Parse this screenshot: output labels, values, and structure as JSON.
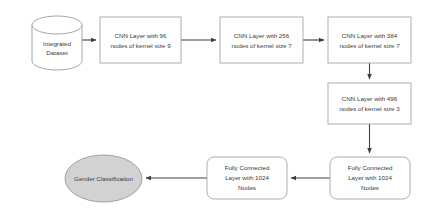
{
  "diagram": {
    "background_color": "#ffffff",
    "nodes": [
      {
        "id": "integrated-dataset",
        "shape": "cylinder",
        "label_lines": [
          "Integrated",
          "Dataset"
        ],
        "fill": "#ffffff",
        "stroke": "#8f8f8f",
        "x": 32,
        "y": 16,
        "width": 50,
        "height": 54
      },
      {
        "id": "cnn-layer-96",
        "shape": "rectangle",
        "label_lines": [
          "CNN Layer with 96",
          "nodes of kernel size 9"
        ],
        "fill": "#ffffff",
        "stroke": "#9a9a9a",
        "x": 100,
        "y": 17,
        "width": 81,
        "height": 46
      },
      {
        "id": "cnn-layer-256",
        "shape": "rectangle",
        "label_lines": [
          "CNN Layer with 256",
          "nodes of kernel size 7"
        ],
        "fill": "#ffffff",
        "stroke": "#9a9a9a",
        "x": 220,
        "y": 17,
        "width": 83,
        "height": 46
      },
      {
        "id": "cnn-layer-384",
        "shape": "rectangle",
        "label_lines": [
          "CNN Layer with 384",
          "nodes of kernel size 7"
        ],
        "fill": "#ffffff",
        "stroke": "#9a9a9a",
        "x": 328,
        "y": 17,
        "width": 83,
        "height": 46
      },
      {
        "id": "cnn-layer-496",
        "shape": "rectangle",
        "label_lines": [
          "CNN Layer with 496",
          "nodes of kernel size 3"
        ],
        "fill": "#ffffff",
        "stroke": "#9a9a9a",
        "x": 328,
        "y": 83,
        "width": 83,
        "height": 41
      },
      {
        "id": "fully-connected-right",
        "shape": "rounded-rectangle",
        "label_lines": [
          "Fully Connected",
          "Layer with 1024",
          "Nodes"
        ],
        "fill": "#ffffff",
        "stroke": "#9a9a9a",
        "x": 330,
        "y": 157,
        "width": 80,
        "height": 42
      },
      {
        "id": "fully-connected-middle",
        "shape": "rounded-rectangle",
        "label_lines": [
          "Fully Connected",
          "Layer with 1024",
          "Nodes"
        ],
        "fill": "#ffffff",
        "stroke": "#9a9a9a",
        "x": 207,
        "y": 157,
        "width": 80,
        "height": 42
      },
      {
        "id": "gender-classification",
        "shape": "ellipse",
        "label_lines": [
          "Gender Classification"
        ],
        "fill": "#d2d2d2",
        "stroke": "#8f8f8f",
        "x": 65,
        "y": 155,
        "width": 77,
        "height": 47
      }
    ],
    "edges": [
      {
        "id": "edge-dataset-to-cnn96",
        "from": "integrated-dataset",
        "to": "cnn-layer-96",
        "direction": "right"
      },
      {
        "id": "edge-cnn96-to-cnn256",
        "from": "cnn-layer-96",
        "to": "cnn-layer-256",
        "direction": "right"
      },
      {
        "id": "edge-cnn256-to-cnn384",
        "from": "cnn-layer-256",
        "to": "cnn-layer-384",
        "direction": "right"
      },
      {
        "id": "edge-cnn384-to-cnn496",
        "from": "cnn-layer-384",
        "to": "cnn-layer-496",
        "direction": "down"
      },
      {
        "id": "edge-cnn496-to-fc-right",
        "from": "cnn-layer-496",
        "to": "fully-connected-right",
        "direction": "down"
      },
      {
        "id": "edge-fc-right-to-fc-middle",
        "from": "fully-connected-right",
        "to": "fully-connected-middle",
        "direction": "left"
      },
      {
        "id": "edge-fc-middle-to-gender",
        "from": "fully-connected-middle",
        "to": "gender-classification",
        "direction": "left"
      }
    ]
  }
}
